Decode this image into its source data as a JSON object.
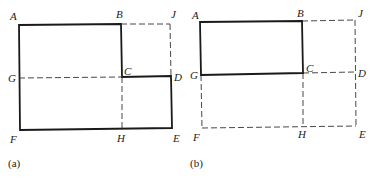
{
  "figures": [
    {
      "id": "a",
      "caption": "(a)",
      "shaded_region": "ABCDEF",
      "points": {
        "A": {
          "label": "A",
          "x": 19,
          "y": 25
        },
        "B": {
          "label": "B",
          "x": 121,
          "y": 24
        },
        "J": {
          "label": "J",
          "x": 170,
          "y": 24
        },
        "G": {
          "label": "G",
          "x": 19,
          "y": 78
        },
        "C": {
          "label": "C",
          "x": 122,
          "y": 77
        },
        "D": {
          "label": "D",
          "x": 171,
          "y": 76
        },
        "F": {
          "label": "F",
          "x": 20,
          "y": 130
        },
        "H": {
          "label": "H",
          "x": 122,
          "y": 129
        },
        "E": {
          "label": "E",
          "x": 172,
          "y": 128
        }
      },
      "dashed_lines": [
        "B-J",
        "J-D",
        "G-C",
        "C-H"
      ]
    },
    {
      "id": "b",
      "caption": "(b)",
      "shaded_region": "ABCG",
      "points": {
        "A": {
          "label": "A",
          "x": 200,
          "y": 22
        },
        "B": {
          "label": "B",
          "x": 302,
          "y": 21
        },
        "J": {
          "label": "J",
          "x": 355,
          "y": 20
        },
        "G": {
          "label": "G",
          "x": 201,
          "y": 75
        },
        "C": {
          "label": "C",
          "x": 303,
          "y": 73
        },
        "D": {
          "label": "D",
          "x": 355,
          "y": 72
        },
        "F": {
          "label": "F",
          "x": 202,
          "y": 128
        },
        "H": {
          "label": "H",
          "x": 303,
          "y": 126
        },
        "E": {
          "label": "E",
          "x": 356,
          "y": 126
        }
      },
      "dashed_lines": [
        "B-J",
        "J-E",
        "C-D",
        "G-F",
        "F-E",
        "C-H"
      ]
    }
  ],
  "colors": {
    "line": "#1a1a1a",
    "hatch": "#333333",
    "background": "#ffffff"
  }
}
